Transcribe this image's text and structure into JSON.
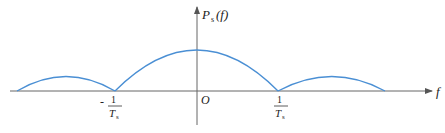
{
  "diagram": {
    "y_axis_label": {
      "main": "P",
      "sub": "s",
      "arg": "(f)"
    },
    "x_axis_label": "f",
    "origin_label": "O",
    "tick_left": {
      "sign": "-",
      "num": "1",
      "den": "T",
      "den_sub": "s"
    },
    "tick_right": {
      "num": "1",
      "den": "T",
      "den_sub": "s"
    },
    "colors": {
      "curve": "#4a8fd4",
      "axis": "#555555"
    }
  }
}
